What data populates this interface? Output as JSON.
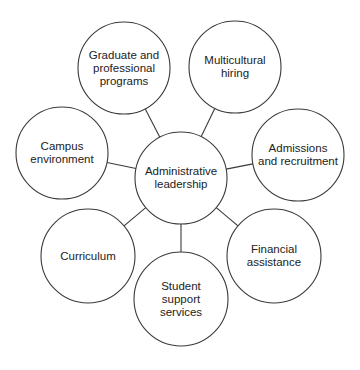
{
  "diagram": {
    "type": "hub-and-spoke",
    "center": {
      "label": "Administrative leadership",
      "lines": [
        "Administrative",
        "leadership"
      ],
      "cx": 181,
      "cy": 178,
      "r": 46
    },
    "nodes": [
      {
        "id": "graduate",
        "label": "Graduate and professional programs",
        "lines": [
          "Graduate and",
          "professional",
          "programs"
        ],
        "cx": 124,
        "cy": 68,
        "r": 46
      },
      {
        "id": "multicultural",
        "label": "Multicultural hiring",
        "lines": [
          "Multicultural",
          "hiring"
        ],
        "cx": 235,
        "cy": 67,
        "r": 46
      },
      {
        "id": "admissions",
        "label": "Admissions and recruitment",
        "lines": [
          "Admissions",
          "and recruitment"
        ],
        "cx": 298,
        "cy": 155,
        "r": 46
      },
      {
        "id": "financial",
        "label": "Financial assistance",
        "lines": [
          "Financial",
          "assistance"
        ],
        "cx": 274,
        "cy": 256,
        "r": 47
      },
      {
        "id": "student-support",
        "label": "Student support services",
        "lines": [
          "Student",
          "support",
          "services"
        ],
        "cx": 181,
        "cy": 299,
        "r": 47
      },
      {
        "id": "curriculum",
        "label": "Curriculum",
        "lines": [
          "Curriculum"
        ],
        "cx": 88,
        "cy": 256,
        "r": 47
      },
      {
        "id": "campus",
        "label": "Campus environment",
        "lines": [
          "Campus",
          "environment"
        ],
        "cx": 62,
        "cy": 153,
        "r": 46
      }
    ],
    "colors": {
      "stroke": "#3a3a3a",
      "fill": "#ffffff",
      "text": "#222222"
    }
  }
}
